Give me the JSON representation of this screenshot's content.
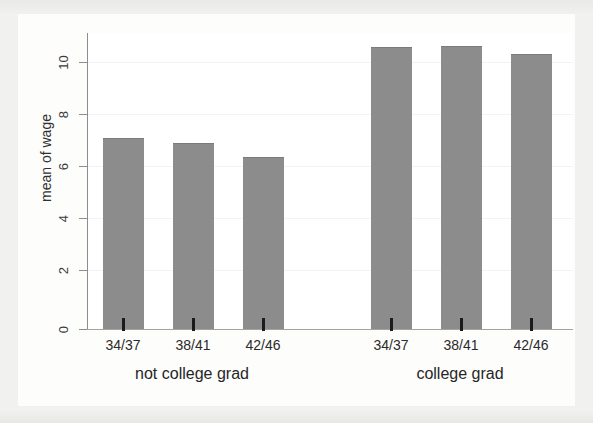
{
  "chart_data": {
    "type": "bar",
    "title": "",
    "subtitle": "",
    "xlabel": "",
    "ylabel": "mean of wage",
    "ylim": [
      0,
      11.4
    ],
    "yticks": [
      0,
      2,
      4,
      6,
      8,
      10
    ],
    "ytick_labels": [
      "0",
      "2",
      "4",
      "6",
      "8",
      "10"
    ],
    "grid": true,
    "legend": "none",
    "categories": [
      "34/37",
      "38/41",
      "42/46",
      "34/37",
      "38/41",
      "42/46"
    ],
    "groups": [
      {
        "label": "not college grad",
        "categories": [
          "34/37",
          "38/41",
          "42/46"
        ],
        "values": [
          7.15,
          6.95,
          6.45
        ]
      },
      {
        "label": "college grad",
        "categories": [
          "34/37",
          "38/41",
          "42/46"
        ],
        "values": [
          10.55,
          10.6,
          10.3
        ]
      }
    ],
    "values": [
      7.15,
      6.95,
      6.45,
      10.55,
      10.6,
      10.3
    ],
    "bar_color": "#8c8c8c",
    "axis_color": "#8d8d8d",
    "background_color": "#ffffff"
  },
  "axis": {
    "y_title": "mean of wage",
    "ticks": [
      {
        "label": "10",
        "value": 10
      },
      {
        "label": "8",
        "value": 8
      },
      {
        "label": "6",
        "value": 6
      },
      {
        "label": "4",
        "value": 4
      },
      {
        "label": "2",
        "value": 2
      },
      {
        "label": "0",
        "value": 0
      }
    ]
  },
  "x_labels": [
    "34/37",
    "38/41",
    "42/46",
    "34/37",
    "38/41",
    "42/46"
  ],
  "group_labels": [
    "not college grad",
    "college grad"
  ]
}
